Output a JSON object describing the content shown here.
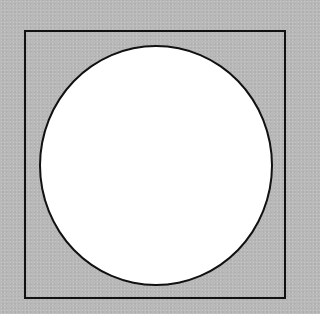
{
  "diagram": {
    "shapes": [
      {
        "type": "square",
        "role": "outer-frame",
        "stroke": "#111111",
        "fill": "none"
      },
      {
        "type": "circle",
        "role": "inscribed-circle",
        "stroke": "#111111",
        "fill": "#ffffff"
      }
    ],
    "background_color": "#b9b9b9"
  }
}
